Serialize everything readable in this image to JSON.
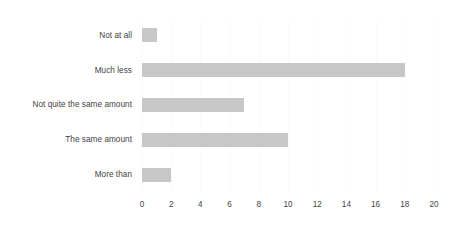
{
  "chart_data": {
    "type": "bar",
    "orientation": "horizontal",
    "title": "",
    "subtitle": "",
    "xlabel": "",
    "ylabel": "",
    "categories": [
      "Not at all",
      "Much less",
      "Not quite the same amount",
      "The same amount",
      "More than"
    ],
    "values": [
      1,
      18,
      7,
      10,
      2
    ],
    "series": [
      {
        "name": "",
        "values": [
          1,
          18,
          7,
          10,
          2
        ]
      }
    ],
    "xlim": [
      0,
      20
    ],
    "xticks": [
      0,
      2,
      4,
      6,
      8,
      10,
      12,
      14,
      16,
      18,
      20
    ],
    "xtick_labels": [
      "0",
      "2",
      "4",
      "6",
      "8",
      "10",
      "12",
      "14",
      "16",
      "18",
      "20"
    ],
    "grid": true,
    "grid_axis": "x",
    "legend": false,
    "legend_position": "none",
    "annotations": [],
    "colors": {
      "bar": "#c7c7c7",
      "gridline": "#fbfbfb",
      "text": "#3f3f3f",
      "background": "#ffffff"
    }
  }
}
